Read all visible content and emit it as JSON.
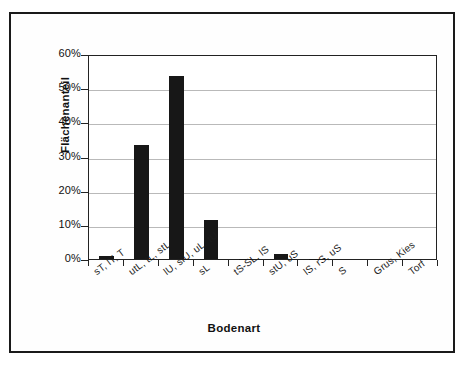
{
  "chart_data": {
    "type": "bar",
    "title": "",
    "xlabel": "Bodenart",
    "ylabel": "Flächenanteil",
    "categories": [
      "sT, lT, T",
      "utL, tL, stL",
      "lU, slU, uL, tU",
      "sL",
      "tS-SL, lS",
      "stU, uS",
      "lS, rS, uS",
      "S",
      "Grus, Kies",
      "Torf"
    ],
    "values": [
      1.0,
      33.5,
      53.5,
      11.3,
      0.15,
      1.6,
      0.1,
      0.0,
      0.0,
      0.0
    ],
    "ylim": [
      0,
      60
    ],
    "yticks": [
      "0%",
      "10%",
      "20%",
      "30%",
      "40%",
      "50%",
      "60%"
    ],
    "ytick_values": [
      0,
      10,
      20,
      30,
      40,
      50,
      60
    ],
    "grid": true,
    "legend": "none",
    "bar_color": "#171717",
    "axis_color": "#222222",
    "grid_color": "#b9b9b9",
    "border_color": "#1a1a1a"
  }
}
